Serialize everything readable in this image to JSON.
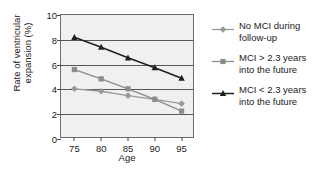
{
  "chart_data": {
    "type": "line",
    "title": "",
    "xlabel": "Age",
    "ylabel_line1": "Rate of ventricular",
    "ylabel_line2": "expansion (%)",
    "x": [
      75,
      80,
      85,
      90,
      95
    ],
    "xticklabels": [
      "75",
      "80",
      "85",
      "90",
      "95"
    ],
    "yticklabels": [
      "0",
      "2",
      "4",
      "6",
      "8",
      "10"
    ],
    "yticks": [
      0,
      2,
      4,
      6,
      8,
      10
    ],
    "xlim": [
      72.5,
      97.5
    ],
    "ylim": [
      0,
      10
    ],
    "grid": "horizontal",
    "legend_position": "right",
    "series": [
      {
        "name": "No MCI during follow-up",
        "legend_line1": "No MCI during",
        "legend_line2": "follow-up",
        "marker": "diamond",
        "color": "#9a9a9a",
        "values": [
          4.05,
          3.85,
          3.5,
          3.2,
          2.85
        ]
      },
      {
        "name": "MCI > 2.3 years into the future",
        "legend_line1": "MCI > 2.3 years",
        "legend_line2": "into the future",
        "marker": "square",
        "color": "#8c8c8c",
        "values": [
          5.6,
          4.85,
          4.05,
          3.2,
          2.25
        ]
      },
      {
        "name": "MCI < 2.3 years into the future",
        "legend_line1": "MCI < 2.3 years",
        "legend_line2": "into the future",
        "marker": "triangle",
        "color": "#1f1f1f",
        "values": [
          8.2,
          7.4,
          6.55,
          5.75,
          4.9
        ]
      }
    ]
  },
  "colors": {
    "plot_background": "#f0f0f0",
    "axis": "#6e6e6e",
    "gridline": "#585858",
    "text": "#1b1b1b",
    "page_background": "#ffffff"
  }
}
